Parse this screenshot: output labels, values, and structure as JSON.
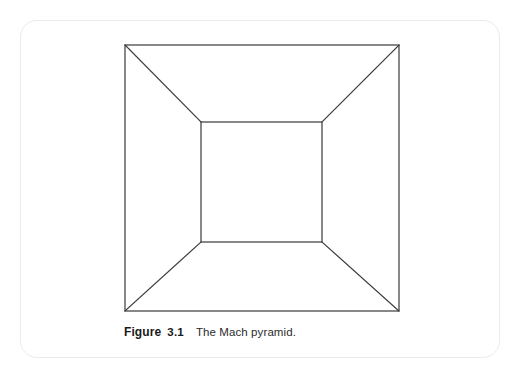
{
  "page": {
    "background_color": "#ffffff",
    "width": 524,
    "height": 372
  },
  "figure_card": {
    "border_color": "#ebebeb",
    "corner_radius": 17
  },
  "figure": {
    "caption_label": "Figure",
    "caption_number": "3.1",
    "caption_text": "The Mach pyramid.",
    "line_color": "#3a3a3a",
    "line_width": 1.2,
    "illustration_name": "mach-pyramid-line-drawing",
    "geometry": {
      "outer_square": {
        "left": 125,
        "top": 45,
        "right": 399,
        "bottom": 311
      },
      "inner_square": {
        "left": 201,
        "top": 122,
        "right": 322,
        "bottom": 242
      },
      "diagonals": [
        {
          "name": "top-left-diagonal",
          "x1": 125,
          "y1": 45,
          "x2": 201,
          "y2": 122
        },
        {
          "name": "top-right-diagonal",
          "x1": 399,
          "y1": 45,
          "x2": 322,
          "y2": 122
        },
        {
          "name": "bottom-left-diagonal",
          "x1": 125,
          "y1": 311,
          "x2": 201,
          "y2": 242
        },
        {
          "name": "bottom-right-diagonal",
          "x1": 399,
          "y1": 311,
          "x2": 322,
          "y2": 242
        }
      ]
    }
  }
}
